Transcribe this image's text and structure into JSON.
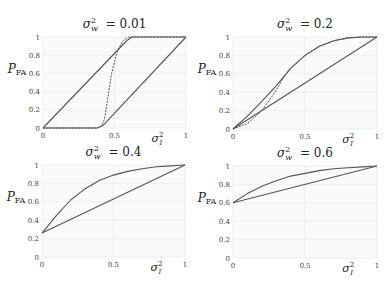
{
  "chart_data": [
    {
      "type": "line",
      "title": "σ_w² = 0.01",
      "title_var": "σ",
      "title_sub": "w",
      "title_sup": "2",
      "title_value": "= 0.01",
      "xlabel": "σ_I²",
      "ylabel": "P_FA",
      "xlim": [
        0,
        1
      ],
      "ylim": [
        0,
        1
      ],
      "xticks": [
        "0",
        "0.5",
        "1"
      ],
      "yticks": [
        "0",
        "0.2",
        "0.4",
        "0.6",
        "0.8",
        "1"
      ],
      "grid": true,
      "series": [
        {
          "name": "upper bound",
          "style": "solid",
          "x": [
            0,
            0.58,
            0.62,
            1
          ],
          "y": [
            0,
            0.95,
            1,
            1
          ]
        },
        {
          "name": "exact",
          "style": "dashed",
          "x": [
            0,
            0.38,
            0.41,
            0.43,
            0.45,
            0.48,
            0.52,
            0.56,
            0.6,
            0.63,
            1
          ],
          "y": [
            0,
            0,
            0.02,
            0.1,
            0.3,
            0.6,
            0.85,
            0.96,
            1,
            1,
            1
          ]
        },
        {
          "name": "lower bound",
          "style": "solid",
          "x": [
            0,
            0.38,
            0.42,
            1
          ],
          "y": [
            0,
            0,
            0.03,
            1
          ]
        }
      ]
    },
    {
      "type": "line",
      "title": "σ_w² = 0.2",
      "title_var": "σ",
      "title_sub": "w",
      "title_sup": "2",
      "title_value": "= 0.2",
      "xlabel": "σ_I²",
      "ylabel": "P_FA",
      "xlim": [
        0,
        1
      ],
      "ylim": [
        0,
        1
      ],
      "xticks": [
        "0",
        "0.5",
        "1"
      ],
      "yticks": [
        "0",
        "0.2",
        "0.4",
        "0.6",
        "0.8",
        "1"
      ],
      "grid": true,
      "series": [
        {
          "name": "upper curve",
          "style": "solid",
          "x": [
            0,
            0.1,
            0.2,
            0.3,
            0.4,
            0.5,
            0.6,
            0.7,
            0.8,
            0.9,
            1
          ],
          "y": [
            0,
            0.14,
            0.3,
            0.47,
            0.66,
            0.8,
            0.9,
            0.96,
            0.99,
            1,
            1
          ]
        },
        {
          "name": "exact",
          "style": "dashed",
          "x": [
            0,
            0.1,
            0.2,
            0.3,
            0.35,
            0.4,
            0.5,
            0.6,
            0.7,
            0.8,
            0.9,
            1
          ],
          "y": [
            0,
            0.06,
            0.2,
            0.42,
            0.56,
            0.66,
            0.8,
            0.9,
            0.96,
            0.99,
            1,
            1
          ]
        },
        {
          "name": "linear",
          "style": "solid",
          "x": [
            0,
            1
          ],
          "y": [
            0,
            1
          ]
        }
      ]
    },
    {
      "type": "line",
      "title": "σ_w² = 0.4",
      "title_var": "σ",
      "title_sub": "w",
      "title_sup": "2",
      "title_value": "= 0.4",
      "xlabel": "σ_I²",
      "ylabel": "P_FA",
      "xlim": [
        0,
        1
      ],
      "ylim": [
        0,
        1
      ],
      "xticks": [
        "0",
        "0.5",
        "1"
      ],
      "yticks": [
        "0",
        "0.2",
        "0.4",
        "0.6",
        "0.8",
        "1"
      ],
      "grid": true,
      "series": [
        {
          "name": "upper curve",
          "style": "solid",
          "x": [
            0,
            0.1,
            0.2,
            0.3,
            0.4,
            0.5,
            0.6,
            0.7,
            0.8,
            0.9,
            1
          ],
          "y": [
            0.26,
            0.45,
            0.62,
            0.74,
            0.83,
            0.89,
            0.93,
            0.96,
            0.98,
            0.99,
            1
          ]
        },
        {
          "name": "linear",
          "style": "solid",
          "x": [
            0,
            1
          ],
          "y": [
            0.26,
            1
          ]
        }
      ]
    },
    {
      "type": "line",
      "title": "σ_w² = 0.6",
      "title_var": "σ",
      "title_sub": "w",
      "title_sup": "2",
      "title_value": "= 0.6",
      "xlabel": "σ_I²",
      "ylabel": "P_FA",
      "xlim": [
        0,
        1
      ],
      "ylim": [
        0,
        1
      ],
      "xticks": [
        "0",
        "0.5",
        "1"
      ],
      "yticks": [
        "0",
        "0.2",
        "0.4",
        "0.6",
        "0.8",
        "1"
      ],
      "grid": true,
      "series": [
        {
          "name": "upper curve",
          "style": "solid",
          "x": [
            0,
            0.1,
            0.2,
            0.3,
            0.4,
            0.5,
            0.6,
            0.7,
            0.8,
            0.9,
            1
          ],
          "y": [
            0.6,
            0.7,
            0.78,
            0.84,
            0.89,
            0.92,
            0.95,
            0.97,
            0.98,
            0.99,
            1
          ]
        },
        {
          "name": "linear",
          "style": "solid",
          "x": [
            0,
            1
          ],
          "y": [
            0.6,
            1
          ]
        }
      ]
    }
  ],
  "layout": {
    "panels": [
      {
        "x0": 43,
        "x1": 186,
        "y0": 128,
        "y1": 37
      },
      {
        "x0": 233,
        "x1": 377,
        "y0": 129,
        "y1": 37
      },
      {
        "x0": 42,
        "x1": 185,
        "y0": 257,
        "y1": 165
      },
      {
        "x0": 233,
        "x1": 377,
        "y0": 258,
        "y1": 166
      }
    ],
    "line_color": "#555555",
    "grid_color": "#e6e6e6",
    "plot_bg": "#fafafa"
  }
}
